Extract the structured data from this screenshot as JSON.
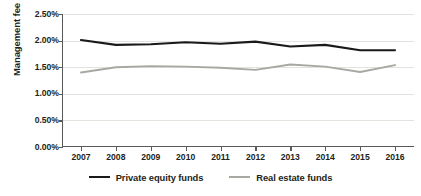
{
  "chart_data": {
    "type": "line",
    "title": "",
    "xlabel": "",
    "ylabel": "Management fee",
    "categories": [
      "2007",
      "2008",
      "2009",
      "2010",
      "2011",
      "2012",
      "2013",
      "2014",
      "2015",
      "2016"
    ],
    "x": [
      2007,
      2008,
      2009,
      2010,
      2011,
      2012,
      2013,
      2014,
      2015,
      2016
    ],
    "series": [
      {
        "name": "Private equity funds",
        "color": "#1a1a1a",
        "values": [
          2.01,
          1.92,
          1.93,
          1.97,
          1.94,
          1.98,
          1.89,
          1.92,
          1.82,
          1.82
        ]
      },
      {
        "name": "Real estate funds",
        "color": "#a8a8a3",
        "values": [
          1.4,
          1.5,
          1.52,
          1.51,
          1.49,
          1.45,
          1.55,
          1.51,
          1.41,
          1.54
        ]
      }
    ],
    "ylim": [
      0.0,
      2.5
    ],
    "ytick_values": [
      0.0,
      0.5,
      1.0,
      1.5,
      2.0,
      2.5
    ],
    "ytick_labels": [
      "0.00%",
      "0.50%",
      "1.00%",
      "1.50%",
      "2.00%",
      "2.50%"
    ],
    "grid": true,
    "grid_color": "#e6e3de",
    "legend_position": "bottom",
    "axis_color": "#58595b",
    "background": "#ffffff"
  },
  "legend": {
    "items": [
      {
        "label": "Private equity funds",
        "color": "#1a1a1a"
      },
      {
        "label": "Real estate funds",
        "color": "#a8a8a3"
      }
    ]
  }
}
